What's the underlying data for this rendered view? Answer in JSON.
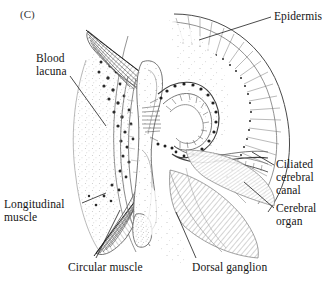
{
  "figure": {
    "panel_id": "(C)",
    "background_color": "#ffffff",
    "ink_color": "#1a1a1a"
  },
  "labels": {
    "epidermis": "Epidermis",
    "blood_lacuna": "Blood\nlacuna",
    "ciliated_cerebral_canal": "Ciliated\ncerebral\ncanal",
    "cerebral_organ": "Cerebral\norgan",
    "longitudinal_muscle": "Longitudinal\nmuscle",
    "circular_muscle": "Circular  muscle",
    "dorsal_ganglion": "Dorsal  ganglion"
  },
  "structures": [
    {
      "name": "epidermis",
      "description": "radiating fan of fine lines along right outer margin"
    },
    {
      "name": "blood-lacuna",
      "description": "stippled region on left flank"
    },
    {
      "name": "ciliated-cerebral-canal",
      "description": "hook shaped ciliated tube in centre"
    },
    {
      "name": "cerebral-organ",
      "description": "hatched glandular mass beneath the canal"
    },
    {
      "name": "longitudinal-muscle",
      "description": "dark tapering fibre bundles upper and lower left"
    },
    {
      "name": "circular-muscle",
      "description": "fine fibre band running down left of centre"
    },
    {
      "name": "dorsal-ganglion",
      "description": "hatched lobe below centre right"
    }
  ]
}
